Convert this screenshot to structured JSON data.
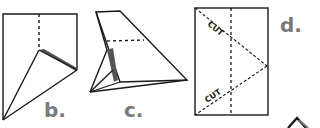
{
  "diagram": {
    "steps": [
      {
        "id": "b",
        "label": "b."
      },
      {
        "id": "c",
        "label": "c."
      },
      {
        "id": "d",
        "label": "d.",
        "cut_labels": [
          "CUT",
          "CUT"
        ]
      }
    ],
    "colors": {
      "line": "#1a1a1a",
      "shade": "#555555",
      "label": "#7a7a7a",
      "background": "#ffffff"
    }
  }
}
